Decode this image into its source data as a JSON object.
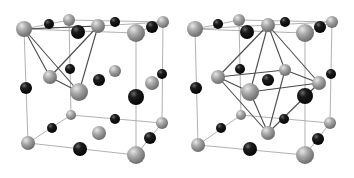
{
  "figure": {
    "colors": {
      "background": "#ffffff",
      "gray_atom": "#9a9a9a",
      "black_atom": "#151515",
      "cell_edge": "#a8a8a8",
      "polyhedron_edge": "#4a4a4a"
    },
    "panels": [
      {
        "name": "tetrahedral-site",
        "cell_edges": [
          [
            [
              24,
              29
            ],
            [
              98,
              26
            ]
          ],
          [
            [
              98,
              26
            ],
            [
              163,
              22
            ]
          ],
          [
            [
              24,
              29
            ],
            [
              69,
              20
            ]
          ],
          [
            [
              69,
              20
            ],
            [
              163,
              22
            ]
          ],
          [
            [
              24,
              29
            ],
            [
              28,
              143
            ]
          ],
          [
            [
              136,
              33
            ],
            [
              136,
              155
            ]
          ],
          [
            [
              163,
              22
            ],
            [
              162,
              123
            ]
          ],
          [
            [
              69,
              20
            ],
            [
              71,
              115
            ]
          ],
          [
            [
              28,
              143
            ],
            [
              136,
              155
            ]
          ],
          [
            [
              136,
              155
            ],
            [
              162,
              123
            ]
          ],
          [
            [
              28,
              143
            ],
            [
              71,
              115
            ]
          ],
          [
            [
              71,
              115
            ],
            [
              162,
              123
            ]
          ],
          [
            [
              24,
              29
            ],
            [
              136,
              33
            ]
          ],
          [
            [
              136,
              33
            ],
            [
              163,
              22
            ]
          ]
        ],
        "polyhedron_edges": [
          [
            [
              24,
              29
            ],
            [
              98,
              26
            ]
          ],
          [
            [
              24,
              29
            ],
            [
              50,
              77
            ]
          ],
          [
            [
              24,
              29
            ],
            [
              79,
              92
            ]
          ],
          [
            [
              98,
              26
            ],
            [
              50,
              77
            ]
          ],
          [
            [
              98,
              26
            ],
            [
              79,
              92
            ]
          ],
          [
            [
              50,
              77
            ],
            [
              79,
              92
            ]
          ]
        ],
        "gray_atoms": [
          [
            24,
            29,
            8
          ],
          [
            69,
            20,
            6
          ],
          [
            98,
            26,
            7
          ],
          [
            136,
            33,
            9
          ],
          [
            163,
            22,
            6
          ],
          [
            50,
            77,
            7
          ],
          [
            79,
            92,
            9
          ],
          [
            115,
            71,
            6
          ],
          [
            152,
            83,
            7
          ],
          [
            71,
            115,
            5
          ],
          [
            99,
            133,
            7
          ],
          [
            162,
            123,
            6
          ],
          [
            28,
            143,
            7
          ],
          [
            136,
            155,
            9
          ]
        ],
        "black_atoms": [
          [
            49,
            24,
            5
          ],
          [
            78,
            32,
            7
          ],
          [
            115,
            22,
            5
          ],
          [
            152,
            27,
            6
          ],
          [
            70,
            69,
            5
          ],
          [
            99,
            80,
            6
          ],
          [
            162,
            74,
            5
          ],
          [
            26,
            88,
            6
          ],
          [
            136,
            97,
            8
          ],
          [
            115,
            119,
            5
          ],
          [
            52,
            128,
            5
          ],
          [
            150,
            138,
            6
          ],
          [
            80,
            149,
            7
          ]
        ]
      },
      {
        "name": "octahedral-site",
        "cell_edges": [
          [
            [
              195,
              29
            ],
            [
              268,
              25
            ]
          ],
          [
            [
              268,
              25
            ],
            [
              332,
              22
            ]
          ],
          [
            [
              195,
              29
            ],
            [
              239,
              20
            ]
          ],
          [
            [
              239,
              20
            ],
            [
              332,
              22
            ]
          ],
          [
            [
              195,
              29
            ],
            [
              198,
              145
            ]
          ],
          [
            [
              305,
              33
            ],
            [
              305,
              155
            ]
          ],
          [
            [
              332,
              22
            ],
            [
              330,
              123
            ]
          ],
          [
            [
              239,
              20
            ],
            [
              241,
              115
            ]
          ],
          [
            [
              198,
              145
            ],
            [
              305,
              155
            ]
          ],
          [
            [
              305,
              155
            ],
            [
              330,
              123
            ]
          ],
          [
            [
              198,
              145
            ],
            [
              241,
              115
            ]
          ],
          [
            [
              241,
              115
            ],
            [
              330,
              123
            ]
          ],
          [
            [
              195,
              29
            ],
            [
              305,
              33
            ]
          ],
          [
            [
              305,
              33
            ],
            [
              332,
              22
            ]
          ]
        ],
        "polyhedron_edges": [
          [
            [
              268,
              25
            ],
            [
              218,
              77
            ]
          ],
          [
            [
              268,
              25
            ],
            [
              285,
              70
            ]
          ],
          [
            [
              268,
              25
            ],
            [
              319,
              83
            ]
          ],
          [
            [
              268,
              25
            ],
            [
              250,
              92
            ]
          ],
          [
            [
              268,
              133
            ],
            [
              218,
              77
            ]
          ],
          [
            [
              268,
              133
            ],
            [
              285,
              70
            ]
          ],
          [
            [
              268,
              133
            ],
            [
              319,
              83
            ]
          ],
          [
            [
              268,
              133
            ],
            [
              250,
              92
            ]
          ],
          [
            [
              218,
              77
            ],
            [
              285,
              70
            ]
          ],
          [
            [
              285,
              70
            ],
            [
              319,
              83
            ]
          ],
          [
            [
              319,
              83
            ],
            [
              250,
              92
            ]
          ],
          [
            [
              250,
              92
            ],
            [
              218,
              77
            ]
          ]
        ],
        "gray_atoms": [
          [
            195,
            29,
            8
          ],
          [
            239,
            20,
            6
          ],
          [
            268,
            25,
            7
          ],
          [
            305,
            33,
            9
          ],
          [
            332,
            22,
            6
          ],
          [
            218,
            77,
            7
          ],
          [
            285,
            70,
            6
          ],
          [
            319,
            83,
            7
          ],
          [
            250,
            92,
            9
          ],
          [
            241,
            115,
            5
          ],
          [
            268,
            133,
            7
          ],
          [
            330,
            123,
            6
          ],
          [
            198,
            145,
            7
          ],
          [
            305,
            155,
            9
          ]
        ],
        "black_atoms": [
          [
            218,
            24,
            5
          ],
          [
            247,
            32,
            7
          ],
          [
            285,
            22,
            5
          ],
          [
            320,
            27,
            6
          ],
          [
            240,
            69,
            5
          ],
          [
            268,
            80,
            6
          ],
          [
            331,
            74,
            5
          ],
          [
            196,
            88,
            6
          ],
          [
            305,
            96,
            8
          ],
          [
            284,
            119,
            5
          ],
          [
            221,
            128,
            5
          ],
          [
            318,
            139,
            6
          ],
          [
            250,
            149,
            7
          ]
        ]
      }
    ]
  }
}
